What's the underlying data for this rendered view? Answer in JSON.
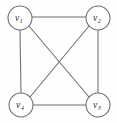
{
  "figure": {
    "name": "complete-graph-k4",
    "background_color": "#fefefe",
    "stroke_color": "#6d6d6d",
    "label_color": "#2b2b2b",
    "width": 117,
    "height": 123
  },
  "graph": {
    "type": "undirected-simple-graph",
    "vertex_count": 4,
    "edge_count": 6,
    "vertices": [
      {
        "id": "v1",
        "base": "v",
        "subscript": "1",
        "label": "v1",
        "cx": 20,
        "cy": 18,
        "r": 12,
        "position": "top-left"
      },
      {
        "id": "v2",
        "base": "v",
        "subscript": "2",
        "label": "v2",
        "cx": 98,
        "cy": 18,
        "r": 12,
        "position": "top-right"
      },
      {
        "id": "v3",
        "base": "v",
        "subscript": "3",
        "label": "v3",
        "cx": 98,
        "cy": 105,
        "r": 12,
        "position": "bottom-right"
      },
      {
        "id": "v4",
        "base": "v",
        "subscript": "4",
        "label": "v4",
        "cx": 21,
        "cy": 105,
        "r": 12,
        "position": "bottom-left"
      }
    ],
    "edges": [
      {
        "id": "e-v1-v2",
        "from": "v1",
        "to": "v2",
        "kind": "top-side",
        "x1": 32,
        "y1": 17,
        "x2": 86,
        "y2": 17
      },
      {
        "id": "e-v2-v3",
        "from": "v2",
        "to": "v3",
        "kind": "right-side",
        "x1": 98,
        "y1": 30,
        "x2": 98,
        "y2": 93
      },
      {
        "id": "e-v4-v3",
        "from": "v4",
        "to": "v3",
        "kind": "bottom-side",
        "x1": 33,
        "y1": 105,
        "x2": 86,
        "y2": 105
      },
      {
        "id": "e-v1-v4",
        "from": "v1",
        "to": "v4",
        "kind": "left-side",
        "x1": 20,
        "y1": 30,
        "x2": 21,
        "y2": 93
      },
      {
        "id": "e-v1-v3",
        "from": "v1",
        "to": "v3",
        "kind": "diagonal",
        "x1": 29,
        "y1": 26,
        "x2": 89,
        "y2": 97
      },
      {
        "id": "e-v2-v4",
        "from": "v2",
        "to": "v4",
        "kind": "diagonal",
        "x1": 89,
        "y1": 26,
        "x2": 30,
        "y2": 97
      }
    ]
  }
}
